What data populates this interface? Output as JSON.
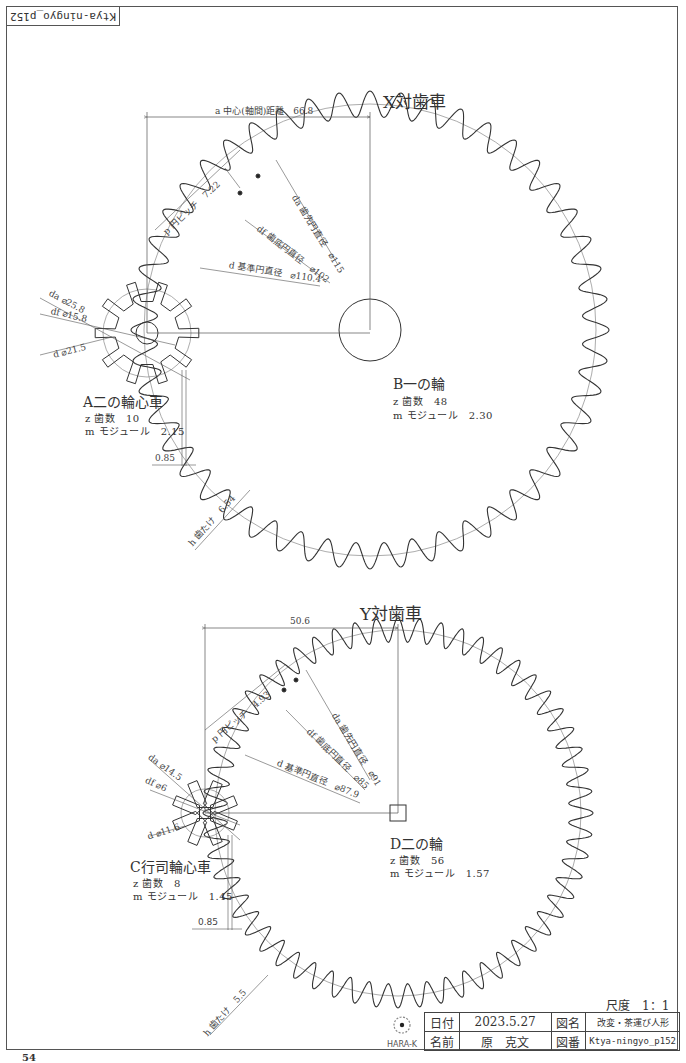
{
  "sheet": {
    "corner_label": "Ktya-ningyo_p152",
    "page_number": "54",
    "scale_label": "尺度　1：1"
  },
  "gear_pair_x": {
    "title": "X対歯車",
    "center_distance_label": "a 中心(軸間)距離　66.8",
    "pitch_label": "p 円ピッチ　7.22",
    "tip_diameter_label": "da 歯先円直径　⌀115",
    "root_diameter_label": "df 歯底円直径　⌀102",
    "pitch_diameter_label": "d 基準円直径　⌀110.4",
    "tooth_depth_label": "h 歯たけ　6.54",
    "clearance_label": "0.85",
    "pinion": {
      "name": "A二の輪心車",
      "teeth": "z 歯数　10",
      "module": "m モジュール　2.15",
      "tip_diameter_label": "da ⌀25.8",
      "root_diameter_label": "df ⌀15.8",
      "pitch_diameter_label": "d ⌀21.5"
    },
    "wheel": {
      "name": "B一の輪",
      "teeth": "z 歯数　48",
      "module": "m モジュール　2.30"
    }
  },
  "gear_pair_y": {
    "title": "Y対歯車",
    "center_distance_label": "50.6",
    "pitch_label": "p 円ピッチ　4.93",
    "tip_diameter_label": "da 歯先円直径　⌀91",
    "root_diameter_label": "df 歯底円直径　⌀85",
    "pitch_diameter_label": "d 基準円直径　⌀87.9",
    "tooth_depth_label": "h 歯たけ　5.5",
    "clearance_label": "0.85",
    "pinion": {
      "name": "C行司輪心車",
      "teeth": "z 歯数　8",
      "module": "m モジュール　1.45",
      "tip_diameter_label": "da ⌀14.5",
      "root_diameter_label": "df ⌀6",
      "pitch_diameter_label": "d ⌀11.6"
    },
    "wheel": {
      "name": "D二の輪",
      "teeth": "z 歯数　56",
      "module": "m モジュール　1.57"
    }
  },
  "title_block": {
    "logo_text": "HARA-K",
    "date_label": "日付",
    "date_value": "2023.5.27",
    "drawing_name_label": "図名",
    "drawing_name_value": "改変・茶運び人形",
    "author_label": "名前",
    "author_value": "原　克文",
    "drawing_number_label": "図番",
    "drawing_number_value": "Ktya-ningyo_p152"
  },
  "colors": {
    "line": "#333333",
    "thin_line": "#666666",
    "background": "#ffffff"
  }
}
